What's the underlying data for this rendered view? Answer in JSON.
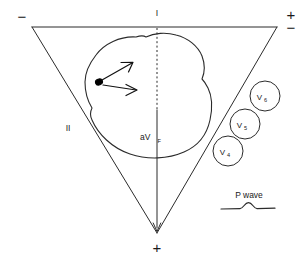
{
  "figure": {
    "background_color": "#ffffff",
    "line_color": "#2b2b2b"
  },
  "triangle": {
    "name": "einthoven-triangle",
    "vertices": {
      "top_left": [
        32,
        27
      ],
      "top_right": [
        277,
        27
      ],
      "bottom_apex": [
        157,
        233
      ]
    },
    "polarity_labels": {
      "top_left_sign": "−",
      "top_right_sign": "+",
      "top_right_sign_secondary": "−",
      "bottom_apex_sign": "+"
    },
    "side_labels": {
      "top_side": "I",
      "left_side": "II",
      "vertical_axis": "aV",
      "vertical_axis_subscript": "F"
    }
  },
  "heart": {
    "name": "heart-outline",
    "origin_dot_label": "",
    "vectors": [
      {
        "name": "vector-upper",
        "direction": "up-right"
      },
      {
        "name": "vector-lower",
        "direction": "right"
      }
    ]
  },
  "precordial_leads": [
    {
      "label": "V",
      "subscript": "6",
      "cx": 265,
      "cy": 96,
      "r": 15
    },
    {
      "label": "V",
      "subscript": "5",
      "cx": 245,
      "cy": 124,
      "r": 15
    },
    {
      "label": "V",
      "subscript": "4",
      "cx": 228,
      "cy": 151,
      "r": 15
    }
  ],
  "pwave": {
    "label": "P wave",
    "name": "p-wave-tracing"
  }
}
